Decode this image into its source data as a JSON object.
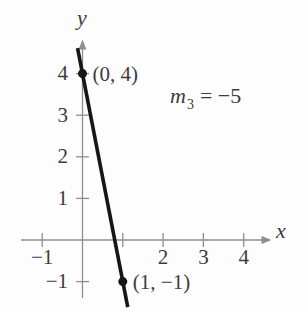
{
  "figure": {
    "background": "#fdfdfd",
    "axis_color": "#8e8e8e",
    "text_color": "#3c3c3c",
    "line_color": "#161616"
  },
  "chart_data": {
    "type": "line",
    "title": "",
    "xlabel": "x",
    "ylabel": "y",
    "xlim": [
      -1.5,
      4.7
    ],
    "ylim": [
      -1.7,
      4.8
    ],
    "grid": false,
    "x_ticks": [
      {
        "value": -1,
        "label": "−1"
      },
      {
        "value": 1,
        "label": ""
      },
      {
        "value": 2,
        "label": "2"
      },
      {
        "value": 3,
        "label": "3"
      },
      {
        "value": 4,
        "label": "4"
      }
    ],
    "y_ticks": [
      {
        "value": 4,
        "label": "4"
      },
      {
        "value": 3,
        "label": "3"
      },
      {
        "value": 2,
        "label": "2"
      },
      {
        "value": 1,
        "label": "1"
      },
      {
        "value": -1,
        "label": "−1"
      }
    ],
    "series": [
      {
        "name": "line-through-points",
        "slope": -5,
        "points": [
          {
            "x": 0,
            "y": 4,
            "label": "(0, 4)"
          },
          {
            "x": 1,
            "y": -1,
            "label": "(1, −1)"
          }
        ]
      }
    ],
    "annotations": [
      {
        "id": "slope-label",
        "var": "m",
        "sub": "3",
        "rest": "= −5"
      }
    ]
  }
}
